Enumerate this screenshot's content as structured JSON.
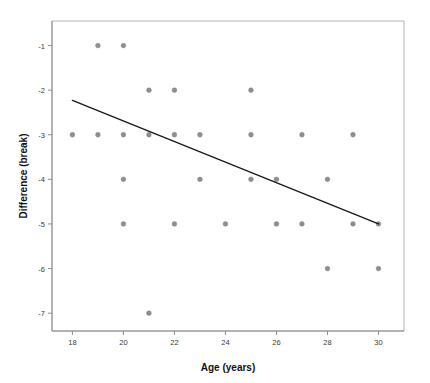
{
  "chart_data": {
    "type": "scatter",
    "title": "",
    "xlabel": "Age (years)",
    "ylabel": "Difference (break)",
    "xlim": [
      17.2,
      31.0
    ],
    "ylim": [
      -7.4,
      -0.45
    ],
    "grid": false,
    "legend": "none",
    "xticks": [
      18,
      20,
      22,
      24,
      26,
      28,
      30
    ],
    "xtick_labels": [
      "18",
      "20",
      "22",
      "24",
      "26",
      "28",
      "30"
    ],
    "yticks": [
      -1,
      -2,
      -3,
      -4,
      -5,
      -6,
      -7
    ],
    "ytick_labels": [
      "-1",
      "-2",
      "-3",
      "-4",
      "-5",
      "-6",
      "-7"
    ],
    "point_color": "#8f8f8f",
    "line_color": "#1a1a1a",
    "frame_color": "#b4b4b4",
    "points": [
      {
        "x": 19,
        "y": -1
      },
      {
        "x": 20,
        "y": -1
      },
      {
        "x": 21,
        "y": -2
      },
      {
        "x": 22,
        "y": -2
      },
      {
        "x": 25,
        "y": -2
      },
      {
        "x": 18,
        "y": -3
      },
      {
        "x": 19,
        "y": -3
      },
      {
        "x": 20,
        "y": -3
      },
      {
        "x": 21,
        "y": -3
      },
      {
        "x": 22,
        "y": -3
      },
      {
        "x": 23,
        "y": -3
      },
      {
        "x": 25,
        "y": -3
      },
      {
        "x": 27,
        "y": -3
      },
      {
        "x": 29,
        "y": -3
      },
      {
        "x": 20,
        "y": -4
      },
      {
        "x": 23,
        "y": -4
      },
      {
        "x": 25,
        "y": -4
      },
      {
        "x": 26,
        "y": -4
      },
      {
        "x": 28,
        "y": -4
      },
      {
        "x": 20,
        "y": -5
      },
      {
        "x": 22,
        "y": -5
      },
      {
        "x": 24,
        "y": -5
      },
      {
        "x": 26,
        "y": -5
      },
      {
        "x": 27,
        "y": -5
      },
      {
        "x": 29,
        "y": -5
      },
      {
        "x": 30,
        "y": -5
      },
      {
        "x": 28,
        "y": -6
      },
      {
        "x": 30,
        "y": -6
      },
      {
        "x": 21,
        "y": -7
      }
    ],
    "fit_line": {
      "label": "linear-fit",
      "x_start": 18,
      "y_start": -2.23,
      "x_end": 30,
      "y_end": -5.0
    }
  }
}
